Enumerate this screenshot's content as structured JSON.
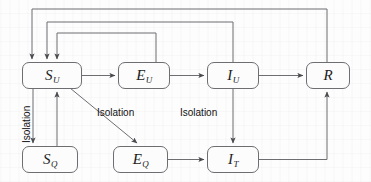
{
  "diagram": {
    "type": "flow-diagram",
    "background_color": "#fdfdfd",
    "stroke_color": "#6d6d72",
    "arrow_color": "#4a4a4f",
    "text_color": "#1c1c1c",
    "nodes": [
      {
        "id": "SU",
        "letter": "S",
        "sub": "U",
        "x": 22,
        "y": 62,
        "w": 60,
        "h": 27
      },
      {
        "id": "EU",
        "letter": "E",
        "sub": "U",
        "x": 118,
        "y": 62,
        "w": 52,
        "h": 27
      },
      {
        "id": "IU",
        "letter": "I",
        "sub": "U",
        "x": 207,
        "y": 62,
        "w": 52,
        "h": 27
      },
      {
        "id": "R",
        "letter": "R",
        "sub": "",
        "x": 306,
        "y": 62,
        "w": 44,
        "h": 27
      },
      {
        "id": "SQ",
        "letter": "S",
        "sub": "Q",
        "x": 22,
        "y": 146,
        "w": 56,
        "h": 27
      },
      {
        "id": "EQ",
        "letter": "E",
        "sub": "Q",
        "x": 113,
        "y": 146,
        "w": 55,
        "h": 27
      },
      {
        "id": "IT",
        "letter": "I",
        "sub": "T",
        "x": 207,
        "y": 146,
        "w": 52,
        "h": 27
      }
    ],
    "edge_labels": [
      {
        "id": "isolation-su-sq",
        "text": "Isolation",
        "orientation": "vertical",
        "x": 22,
        "y": 143
      },
      {
        "id": "isolation-su-eq",
        "text": "Isolation",
        "orientation": "horizontal",
        "x": 97,
        "y": 108
      },
      {
        "id": "isolation-iu-it",
        "text": "Isolation",
        "orientation": "horizontal",
        "x": 180,
        "y": 108
      }
    ],
    "edges": [
      {
        "from": "SU",
        "to": "EU",
        "kind": "horizontal-arrow"
      },
      {
        "from": "EU",
        "to": "IU",
        "kind": "horizontal-arrow"
      },
      {
        "from": "IU",
        "to": "R",
        "kind": "horizontal-arrow"
      },
      {
        "from": "SU",
        "to": "SQ",
        "kind": "vertical-arrow-down"
      },
      {
        "from": "SQ",
        "to": "SU",
        "kind": "vertical-arrow-up"
      },
      {
        "from": "SU",
        "to": "EQ",
        "kind": "diagonal-arrow"
      },
      {
        "from": "EQ",
        "to": "IT",
        "kind": "horizontal-arrow"
      },
      {
        "from": "IU",
        "to": "IT",
        "kind": "vertical-arrow-down"
      },
      {
        "from": "IT",
        "to": "R",
        "kind": "elbow-arrow-up"
      },
      {
        "from": "EU",
        "to": "SU",
        "kind": "feedback-loop-inner"
      },
      {
        "from": "IU",
        "to": "SU",
        "kind": "feedback-loop-middle"
      },
      {
        "from": "R",
        "to": "SU",
        "kind": "feedback-loop-outer"
      }
    ]
  }
}
